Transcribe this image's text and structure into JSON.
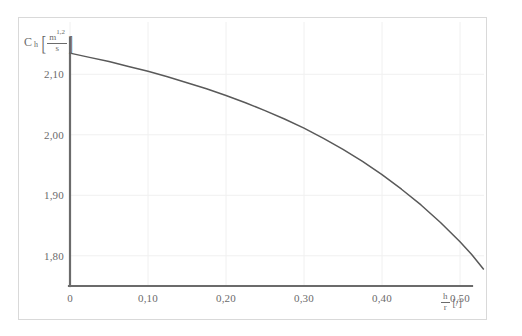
{
  "figure": {
    "background_color": "#ffffff",
    "frame_color": "#d9d9d9",
    "axis_color": "#6b6b6b",
    "curve_color": "#595959",
    "grid_color": "#f0f0f0",
    "label_color": "#6b6b6b"
  },
  "y_axis_title": {
    "symbol": "C",
    "subscript": "h",
    "bracket_open": "[",
    "bracket_close": "]",
    "unit_numerator": "m",
    "unit_exponent": "1,2",
    "unit_denominator": "s"
  },
  "x_axis_title": {
    "bracket_open": "[",
    "bracket_close": "]",
    "numerator": "h",
    "denominator": "r",
    "unit": "[/]"
  },
  "chart_data": {
    "type": "line",
    "title": "",
    "subtitle": "",
    "xlabel": "h/r [/]",
    "ylabel": "C_h [m^1,2/s]",
    "xlim": [
      0,
      0.55
    ],
    "ylim": [
      1.75,
      2.16
    ],
    "grid": true,
    "legend": null,
    "legend_position": "none",
    "xticks": [
      0,
      0.1,
      0.2,
      0.3,
      0.4,
      0.5
    ],
    "xticklabels": [
      "0",
      "0,10",
      "0,20",
      "0,30",
      "0,40",
      "0,50"
    ],
    "yticks": [
      1.8,
      1.9,
      2.0,
      2.1
    ],
    "yticklabels": [
      "1,80",
      "1,90",
      "2,00",
      "2,10"
    ],
    "series": [
      {
        "name": "Ch",
        "color": "#595959",
        "x": [
          0.0,
          0.025,
          0.05,
          0.075,
          0.1,
          0.125,
          0.15,
          0.175,
          0.2,
          0.225,
          0.25,
          0.275,
          0.3,
          0.325,
          0.35,
          0.375,
          0.4,
          0.425,
          0.45,
          0.475,
          0.5,
          0.515,
          0.53
        ],
        "y": [
          2.135,
          2.128,
          2.121,
          2.113,
          2.105,
          2.096,
          2.086,
          2.076,
          2.065,
          2.053,
          2.04,
          2.026,
          2.011,
          1.994,
          1.976,
          1.956,
          1.934,
          1.91,
          1.884,
          1.855,
          1.823,
          1.802,
          1.778
        ]
      }
    ],
    "annotations": []
  }
}
